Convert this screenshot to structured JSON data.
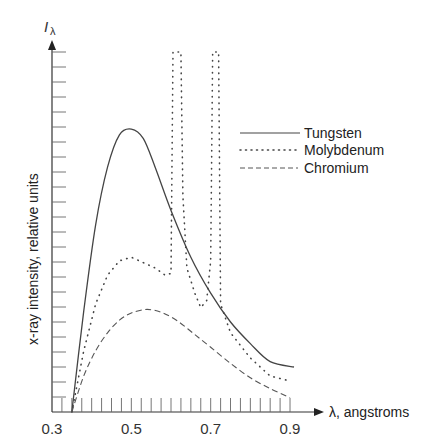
{
  "chart_data": {
    "type": "line",
    "title": "",
    "xlabel": "λ, angstroms",
    "ylabel": "x-ray intensity, relative units",
    "y_symbol": "I",
    "y_symbol_sub": "λ",
    "xlim": [
      0.3,
      0.95
    ],
    "ylim": [
      0,
      100
    ],
    "x_tick_labels": [
      "0.3",
      "0.5",
      "0.7",
      "0.9"
    ],
    "x_tick_values": [
      0.3,
      0.5,
      0.7,
      0.9
    ],
    "x_minor_tick_step": 0.025,
    "y_minor_tick_count": 24,
    "grid": false,
    "legend_position": "upper right",
    "series": [
      {
        "name": "Tungsten",
        "style": "solid",
        "x": [
          0.35,
          0.38,
          0.41,
          0.44,
          0.47,
          0.5,
          0.53,
          0.56,
          0.6,
          0.65,
          0.7,
          0.75,
          0.8,
          0.85,
          0.91
        ],
        "y": [
          0,
          28,
          52,
          68,
          77,
          78.6,
          76,
          68,
          56,
          43,
          33,
          25,
          19,
          14,
          12.5
        ]
      },
      {
        "name": "Molybdenum",
        "style": "dotted",
        "x": [
          0.35,
          0.38,
          0.41,
          0.44,
          0.47,
          0.5,
          0.53,
          0.56,
          0.585,
          0.6,
          0.605,
          0.61,
          0.615,
          0.625,
          0.63,
          0.64,
          0.66,
          0.675,
          0.69,
          0.7,
          0.705,
          0.71,
          0.715,
          0.72,
          0.725,
          0.75,
          0.8,
          0.85,
          0.9
        ],
        "y": [
          0,
          17,
          30,
          38,
          42,
          43,
          41.5,
          40,
          38,
          38.5,
          100,
          100,
          100,
          100,
          60,
          40,
          33,
          29,
          31,
          42,
          100,
          100,
          100,
          100,
          30,
          22,
          15,
          10,
          8.6
        ]
      },
      {
        "name": "Chromium",
        "style": "dashed",
        "x": [
          0.35,
          0.38,
          0.41,
          0.44,
          0.47,
          0.5,
          0.54,
          0.58,
          0.62,
          0.66,
          0.7,
          0.75,
          0.8,
          0.85,
          0.9
        ],
        "y": [
          0,
          10,
          17,
          22,
          25.5,
          27.5,
          28.5,
          27.5,
          25,
          21.5,
          18,
          13.5,
          9.5,
          6.5,
          4
        ]
      }
    ]
  },
  "legend": {
    "items": [
      {
        "label": "Tungsten",
        "style": "solid"
      },
      {
        "label": "Molybdenum",
        "style": "dotted"
      },
      {
        "label": "Chromium",
        "style": "dashed"
      }
    ]
  },
  "axes": {
    "x_label": "λ, angstroms",
    "y_label": "x-ray intensity, relative units",
    "y_symbol": "I",
    "y_symbol_sub": "λ"
  }
}
